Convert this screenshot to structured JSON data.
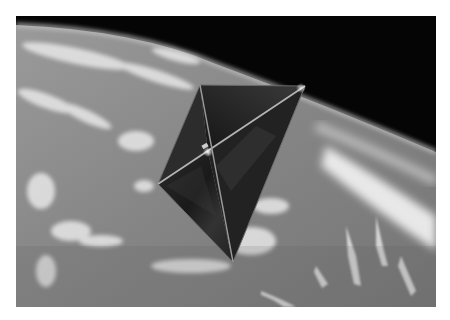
{
  "image": {
    "subject": "solar sail spacecraft over Earth",
    "alt": "Square solar sail spacecraft with diagonal booms, in orbit above a cloud-covered Earth with black space at the top right",
    "style": "grayscale photograph",
    "frame": {
      "x": 16,
      "y": 16,
      "width": 420,
      "height": 291,
      "border_color": "#ffffff"
    },
    "colors": {
      "space": "#050505",
      "earth_mid": "#8a8a8a",
      "earth_dark": "#6e6e6e",
      "cloud": "#f2f2f2",
      "sail_dark": "#1c1c1c",
      "sail_light": "#4a4a4a",
      "boom": "#b8b8b8"
    },
    "sail": {
      "corners": {
        "top": [
          184,
          69
        ],
        "right": [
          289,
          70
        ],
        "bottom": [
          217,
          246
        ],
        "left": [
          142,
          168
        ]
      },
      "hub": [
        192,
        136
      ]
    }
  }
}
